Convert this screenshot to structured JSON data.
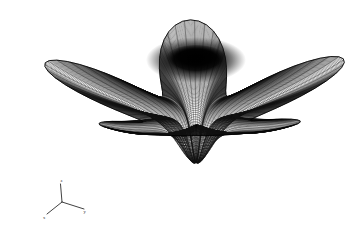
{
  "figure": {
    "name": "3d-wireframe-surface-plot",
    "background_color": "#ffffff",
    "line_color": "#111111",
    "render_style": "wireframe-mesh",
    "width": 352,
    "height": 229
  },
  "axes_triad": {
    "name": "coordinate-axis-indicator",
    "origin": {
      "x": 62,
      "y": 202
    },
    "axes": [
      {
        "id": "z",
        "label": "z",
        "tip": {
          "x": 60.5,
          "y": 184
        },
        "label_pos": {
          "x": 61.5,
          "y": 182.4
        }
      },
      {
        "id": "y",
        "label": "y",
        "tip": {
          "x": 84,
          "y": 209
        },
        "label_pos": {
          "x": 84.6,
          "y": 213.0
        }
      },
      {
        "id": "x",
        "label": "x",
        "tip": {
          "x": 47,
          "y": 214
        },
        "label_pos": {
          "x": 44.2,
          "y": 218.6
        }
      }
    ]
  },
  "surface": {
    "type": "radial-star-surface",
    "lobes": 5,
    "center": {
      "x": 196,
      "y": 63
    },
    "center_depression": {
      "present": true,
      "shading": "very-dark",
      "radius_x": 46,
      "radius_y": 21,
      "color": "#0a0a0a"
    },
    "extents": {
      "left_tip": {
        "x": 20,
        "y": 140
      },
      "right_tip": {
        "x": 340,
        "y": 86
      },
      "top_petal": {
        "x": 118,
        "y": 18
      },
      "front_lobe_bottom": {
        "x": 205,
        "y": 201
      }
    },
    "mesh": {
      "radial_lines": 96,
      "circumferential_lines": 40,
      "stroke_width": 0.45
    },
    "projection": {
      "type": "oblique-perspective",
      "elevation_deg": 26,
      "azimuth_deg": 38,
      "y_squash": 0.42
    }
  },
  "chart_data": {
    "type": "surface",
    "title": "",
    "xlabel": "x",
    "ylabel": "y",
    "zlabel": "z",
    "grid": false,
    "legend": "none",
    "surface_function": "r(theta) = R0 * (1 + a*cos(5*theta)) ; z = -H / (1 + (r/r0)^2)",
    "lobe_count": 5,
    "lobe_angles_deg": [
      90,
      162,
      234,
      306,
      18
    ],
    "radial_samples": 96,
    "angular_samples": 120,
    "z_range": [
      -1.0,
      0.35
    ]
  }
}
